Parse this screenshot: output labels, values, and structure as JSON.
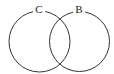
{
  "diagram": {
    "type": "venn",
    "sets": [
      {
        "label": "C",
        "cx": 39.5,
        "cy": 41.5,
        "r": 30.5
      },
      {
        "label": "B",
        "cx": 79.5,
        "cy": 41.5,
        "r": 30
      }
    ],
    "stroke_color": "#333333",
    "background": "#ffffff"
  }
}
